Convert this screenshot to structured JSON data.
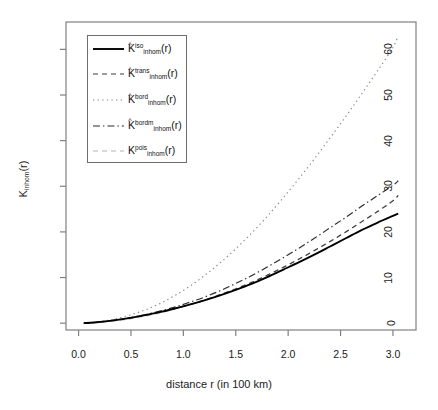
{
  "figure": {
    "xlabel": "distance r (in 100 km)",
    "ylabel_base": "K",
    "ylabel_sub": "inhom",
    "ylabel_tail": "(r)",
    "background": "#ffffff",
    "frame_color": "#808080"
  },
  "axes": {
    "x": {
      "ticks": [
        "0.0",
        "0.5",
        "1.0",
        "1.5",
        "2.0",
        "2.5",
        "3.0"
      ],
      "values": [
        0.0,
        0.5,
        1.0,
        1.5,
        2.0,
        2.5,
        3.0
      ],
      "min": -0.12,
      "max": 3.22
    },
    "y": {
      "ticks": [
        "0",
        "10",
        "20",
        "30",
        "40",
        "50",
        "60"
      ],
      "values": [
        0,
        10,
        20,
        30,
        40,
        50,
        60
      ],
      "min": -1.5,
      "max": 66
    }
  },
  "legend": {
    "entries": [
      {
        "base": "K",
        "hat": "^",
        "sup": "iso",
        "sub": "inhom",
        "tail": "(r)",
        "style": "solid",
        "color": "#000000",
        "width": 1.9
      },
      {
        "base": "K",
        "hat": "^",
        "sup": "trans",
        "sub": "inhom",
        "tail": "(r)",
        "style": "dashed",
        "color": "#3a3a3a",
        "width": 1.1
      },
      {
        "base": "K",
        "hat": "^",
        "sup": "bord",
        "sub": "inhom",
        "tail": "(r)",
        "style": "dotted",
        "color": "#8c8c8c",
        "width": 1.1
      },
      {
        "base": "K",
        "hat": "^",
        "sup": "bordm",
        "sub": "inhom",
        "tail": "(r)",
        "style": "dashdot",
        "color": "#2b2b2b",
        "width": 1.1
      },
      {
        "base": "K",
        "hat": "",
        "sup": "pois",
        "sub": "inhom",
        "tail": "(r)",
        "style": "lightdash",
        "color": "#b4b4b4",
        "width": 1.1
      }
    ]
  },
  "chart_data": {
    "type": "line",
    "title": "",
    "xlabel": "distance r (in 100 km)",
    "ylabel": "K_inhom(r)",
    "xlim": [
      -0.12,
      3.22
    ],
    "ylim": [
      -1.5,
      66
    ],
    "grid": false,
    "legend_position": "top-left",
    "x": [
      0.05,
      0.15,
      0.3,
      0.45,
      0.6,
      0.75,
      0.9,
      1.05,
      1.2,
      1.35,
      1.5,
      1.65,
      1.8,
      1.95,
      2.1,
      2.25,
      2.4,
      2.55,
      2.7,
      2.85,
      3.0,
      3.05
    ],
    "series": [
      {
        "name": "K_inhom^iso(r)",
        "style": "solid",
        "color": "#000000",
        "values": [
          0.0,
          0.15,
          0.5,
          1.0,
          1.6,
          2.3,
          3.1,
          4.0,
          5.0,
          6.1,
          7.3,
          8.6,
          10.1,
          11.7,
          13.3,
          15.0,
          16.8,
          18.6,
          20.4,
          22.0,
          23.5,
          24.0
        ]
      },
      {
        "name": "K_inhom^trans(r)",
        "style": "dashed",
        "color": "#3a3a3a",
        "values": [
          0.0,
          0.15,
          0.5,
          1.0,
          1.6,
          2.3,
          3.1,
          4.0,
          5.0,
          6.2,
          7.5,
          8.9,
          10.5,
          12.2,
          14.0,
          15.9,
          17.9,
          20.0,
          22.2,
          24.4,
          26.8,
          28.0
        ]
      },
      {
        "name": "K_inhom^bord(r)",
        "style": "dotted",
        "color": "#8c8c8c",
        "values": [
          0.0,
          0.2,
          0.7,
          1.5,
          2.6,
          4.0,
          5.8,
          7.9,
          10.4,
          13.2,
          16.3,
          19.7,
          23.4,
          27.4,
          31.6,
          36.0,
          40.6,
          45.3,
          50.2,
          55.2,
          60.4,
          63.0
        ]
      },
      {
        "name": "K_inhom^bordm(r)",
        "style": "dashdot",
        "color": "#2b2b2b",
        "values": [
          0.0,
          0.15,
          0.5,
          1.05,
          1.7,
          2.5,
          3.4,
          4.5,
          5.7,
          7.1,
          8.7,
          10.4,
          12.3,
          14.3,
          16.4,
          18.6,
          20.9,
          23.2,
          25.6,
          27.9,
          30.2,
          31.2
        ]
      },
      {
        "name": "K_inhom^pois(r)",
        "style": "lightdash",
        "color": "#b4b4b4",
        "values": [
          0.0,
          0.1,
          0.35,
          0.8,
          1.4,
          2.1,
          3.0,
          4.0,
          5.1,
          6.3,
          7.6,
          9.0,
          10.5,
          12.2,
          14.0,
          15.9,
          17.9,
          20.0,
          22.2,
          24.5,
          26.9,
          28.0
        ]
      }
    ]
  }
}
